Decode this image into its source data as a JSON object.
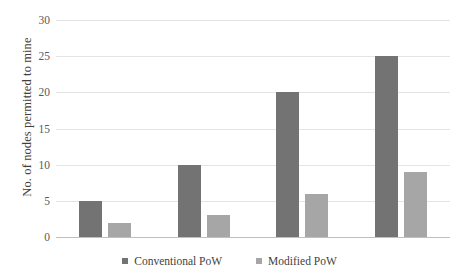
{
  "chart_data": {
    "type": "bar",
    "title": "",
    "subtitle": "",
    "xlabel": "",
    "ylabel": "No. of nodes permitted to mine",
    "ylim": [
      0,
      30
    ],
    "yticks": [
      0,
      5,
      10,
      15,
      20,
      25,
      30
    ],
    "ytick_labels": [
      "0",
      "5",
      "10",
      "15",
      "20",
      "25",
      "30"
    ],
    "categories": [
      "",
      "",
      "",
      ""
    ],
    "xtick_labels": [],
    "grid": "horizontal",
    "legend_position": "bottom-center",
    "legend_orientation": "horizontal",
    "series": [
      {
        "name": "Conventional PoW",
        "color": "#737373",
        "values": [
          5,
          10,
          20,
          25
        ]
      },
      {
        "name": "Modified PoW",
        "color": "#a6a6a6",
        "values": [
          2,
          3,
          6,
          9
        ]
      }
    ],
    "annotations": [],
    "background_color": "#ffffff",
    "gridline_color": "#e4e4e4",
    "axis_color": "#bfbfbf"
  }
}
